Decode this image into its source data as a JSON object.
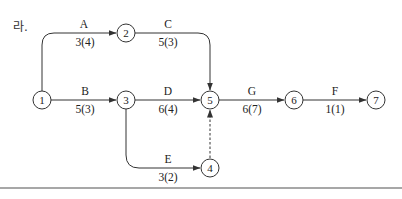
{
  "problem_label": "라.",
  "nodes": [
    {
      "id": "1",
      "label": "1"
    },
    {
      "id": "2",
      "label": "2"
    },
    {
      "id": "3",
      "label": "3"
    },
    {
      "id": "4",
      "label": "4"
    },
    {
      "id": "5",
      "label": "5"
    },
    {
      "id": "6",
      "label": "6"
    },
    {
      "id": "7",
      "label": "7"
    }
  ],
  "activities": [
    {
      "name": "A",
      "from": "1",
      "to": "2",
      "duration": "3(4)"
    },
    {
      "name": "B",
      "from": "1",
      "to": "3",
      "duration": "5(3)"
    },
    {
      "name": "C",
      "from": "2",
      "to": "5",
      "duration": "5(3)"
    },
    {
      "name": "D",
      "from": "3",
      "to": "5",
      "duration": "6(4)"
    },
    {
      "name": "E",
      "from": "3",
      "to": "4",
      "duration": "3(2)"
    },
    {
      "name": "G",
      "from": "5",
      "to": "6",
      "duration": "6(7)"
    },
    {
      "name": "F",
      "from": "6",
      "to": "7",
      "duration": "1(1)"
    }
  ],
  "dummy": {
    "from": "4",
    "to": "5",
    "style": "dashed"
  },
  "colors": {
    "line": "#333333",
    "rule": "#8a8a8a"
  }
}
